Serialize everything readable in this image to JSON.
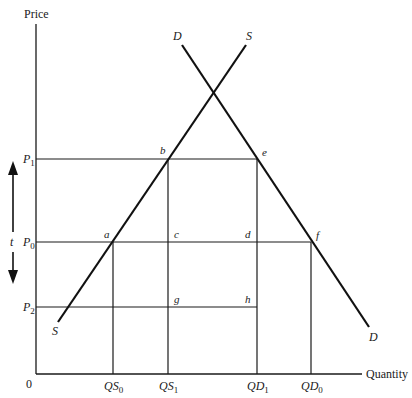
{
  "diagram": {
    "title": "",
    "axes": {
      "y_label": "Price",
      "x_label": "Quantity",
      "origin_label": "0"
    },
    "curves": {
      "supply": {
        "label_top": "S",
        "label_bottom": "S"
      },
      "demand": {
        "label_top": "D",
        "label_bottom": "D"
      }
    },
    "price_levels": [
      {
        "id": "P1",
        "base": "P",
        "sub": "1"
      },
      {
        "id": "P0",
        "base": "P",
        "sub": "0"
      },
      {
        "id": "P2",
        "base": "P",
        "sub": "2"
      }
    ],
    "quantities": [
      {
        "id": "QS0",
        "base": "QS",
        "sub": "0"
      },
      {
        "id": "QS1",
        "base": "QS",
        "sub": "1"
      },
      {
        "id": "QD1",
        "base": "QD",
        "sub": "1"
      },
      {
        "id": "QD0",
        "base": "QD",
        "sub": "0"
      }
    ],
    "points": {
      "a": "a",
      "b": "b",
      "c": "c",
      "d": "d",
      "e": "e",
      "f": "f",
      "g": "g",
      "h": "h"
    },
    "tariff_arrow_label": "t",
    "colors": {
      "line": "#111111",
      "background": "#ffffff"
    }
  }
}
